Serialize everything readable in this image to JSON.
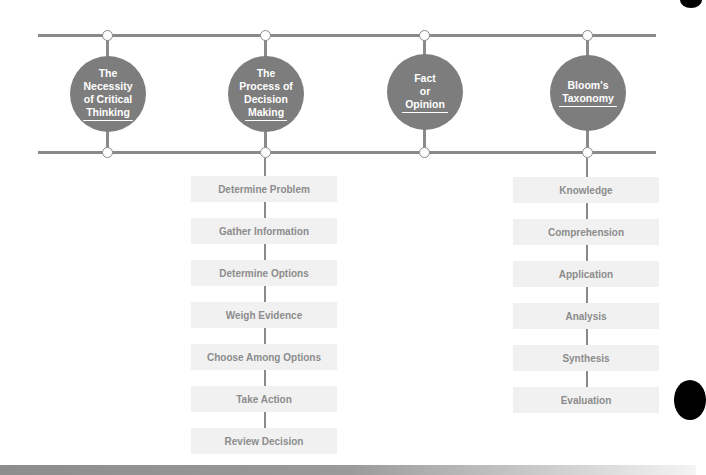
{
  "diagram": {
    "topics": [
      {
        "lines": [
          "The",
          "Necessity",
          "of Critical",
          "Thinking"
        ]
      },
      {
        "lines": [
          "The",
          "Process of",
          "Decision",
          "Making"
        ]
      },
      {
        "lines": [
          "Fact",
          "or",
          "Opinion"
        ]
      },
      {
        "lines": [
          "Bloom's",
          "Taxonomy"
        ]
      }
    ],
    "decision_steps": [
      "Determine Problem",
      "Gather Information",
      "Determine Options",
      "Weigh Evidence",
      "Choose Among Options",
      "Take Action",
      "Review Decision"
    ],
    "bloom_levels": [
      "Knowledge",
      "Comprehension",
      "Application",
      "Analysis",
      "Synthesis",
      "Evaluation"
    ],
    "colors": {
      "line": "#8a8a8a",
      "topic_fill": "#7d7d7d",
      "step_fill": "#f1f1f1",
      "step_text": "#8c8c8c"
    }
  }
}
